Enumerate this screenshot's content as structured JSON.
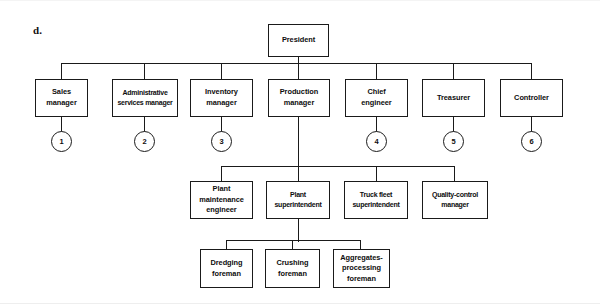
{
  "figure": {
    "label": "d.",
    "type": "organization-chart",
    "nodes": {
      "president": "President",
      "sales_manager": "Sales\nmanager",
      "administrative_services_manager": "Administrative\nservices manager",
      "inventory_manager": "Inventory\nmanager",
      "production_manager": "Production\nmanager",
      "chief_engineer": "Chief\nengineer",
      "treasurer": "Treasurer",
      "controller": "Controller",
      "plant_maintenance_engineer": "Plant\nmaintenance\nengineer",
      "plant_superintendent": "Plant\nsuperintendent",
      "truck_fleet_superintendent": "Truck fleet\nsuperintendent",
      "quality_control_manager": "Quality-control\nmanager",
      "dredging_foreman": "Dredging\nforeman",
      "crushing_foreman": "Crushing\nforeman",
      "aggregates_processing_foreman": "Aggregates-\nprocessing\nforeman"
    },
    "markers": {
      "sales": "1",
      "administrative": "2",
      "inventory": "3",
      "chief_engineer": "4",
      "treasurer": "5",
      "controller": "6"
    },
    "colors": {
      "line": "#1a1a1a",
      "box_fill": "#ffffff",
      "text": "#0d0d0d",
      "background": "#ffffff"
    }
  }
}
